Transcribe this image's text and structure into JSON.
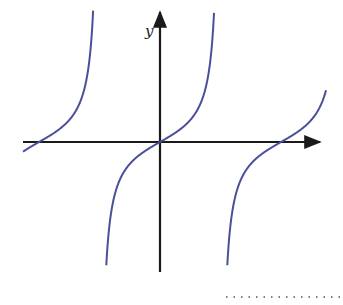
{
  "figure": {
    "axis_labels": {
      "y": "y"
    },
    "colors": {
      "curve": "#4a4f9a",
      "axis": "#1a1a1a",
      "dots": "#555555"
    }
  },
  "chart_data": {
    "type": "line",
    "title": "",
    "xlabel": "",
    "ylabel": "y",
    "function": "y = tan(x)-like, period ≈ one asymptote spacing",
    "branches": 4,
    "zero_crossings_px": [
      39,
      160,
      281
    ],
    "asymptotes_px": [
      100,
      221
    ],
    "grid": false,
    "legend": false
  },
  "answer_blank": {
    "style": "dotted"
  }
}
